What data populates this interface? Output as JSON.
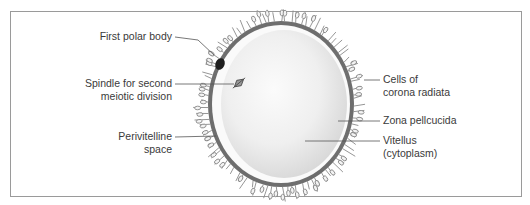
{
  "figure": {
    "type": "labeled anatomical diagram",
    "colors": {
      "frame": "#9a9a9a",
      "zona": "#6e6e6e",
      "vitellus": "#ededed",
      "perivitelline": "#fafafa",
      "corona_cells": "#8a8a8a",
      "polar_body": "#1e1e1e",
      "leader_lines": "#555555",
      "text": "#3a3a3a"
    }
  },
  "labels": {
    "left": [
      {
        "id": "first-polar-body",
        "lines": [
          "First polar body"
        ]
      },
      {
        "id": "spindle",
        "lines": [
          "Spindle for second",
          "meiotic division"
        ]
      },
      {
        "id": "perivitelline-space",
        "lines": [
          "Perivitelline",
          "space"
        ]
      }
    ],
    "right": [
      {
        "id": "corona-radiata",
        "lines": [
          "Cells of",
          "corona radiata"
        ]
      },
      {
        "id": "zona-pellucida",
        "lines": [
          "Zona pellcucida"
        ]
      },
      {
        "id": "vitellus",
        "lines": [
          "Vitellus",
          "(cytoplasm)"
        ]
      }
    ]
  }
}
